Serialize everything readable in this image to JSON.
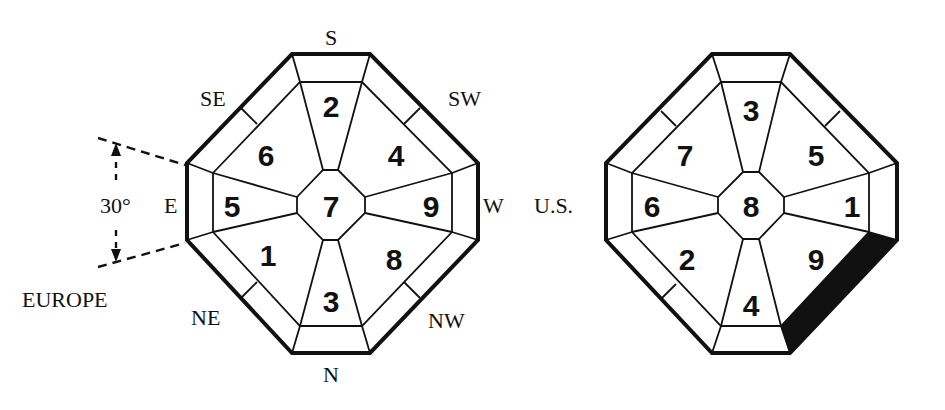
{
  "left_diagram": {
    "name": "Europe compass",
    "region_label": "EUROPE",
    "angle_label": "30°",
    "directions": {
      "top": "S",
      "top_right": "SW",
      "right": "W",
      "bottom_right": "NW",
      "bottom": "N",
      "bottom_left": "NE",
      "left": "E",
      "top_left": "SE"
    },
    "sectors": {
      "center": "7",
      "top": "2",
      "top_right": "4",
      "right": "9",
      "bottom_right": "8",
      "bottom": "3",
      "bottom_left": "1",
      "left": "5",
      "top_left": "6"
    }
  },
  "right_diagram": {
    "name": "U.S. compass",
    "region_label": "U.S.",
    "sectors": {
      "center": "8",
      "top": "3",
      "top_right": "5",
      "right": "1",
      "bottom_right": "9",
      "bottom": "4",
      "bottom_left": "2",
      "left": "6",
      "top_left": "7"
    },
    "highlighted_edge": "bottom_right",
    "highlight_color": "#111111"
  }
}
